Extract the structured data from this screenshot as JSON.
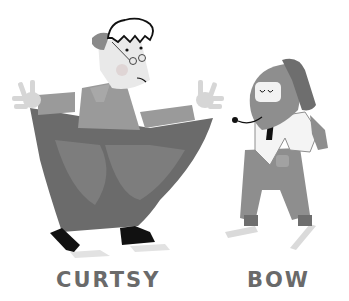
{
  "illustration": {
    "background": "#ffffff",
    "figures": [
      {
        "name": "curtsying-woman",
        "description": "Woman with glasses and white curly hair holding out a wide skirt in a curtsy"
      },
      {
        "name": "bowing-dog",
        "description": "Dog wearing white shirt, black tie and overalls bowing"
      }
    ],
    "colors": {
      "skirt": "#6b6b6b",
      "skirt_pattern": "#7d7d7d",
      "top": "#9a9a9a",
      "skin": "#d6d6d6",
      "hair_outline": "#111111",
      "shoes": "#111111",
      "dog_body": "#8e8e8e",
      "dog_ear": "#6e6e6e",
      "shirt": "#f4f4f4",
      "label": "#6a6a6a"
    }
  },
  "labels": {
    "left": "CURTSY",
    "right": "BOW"
  }
}
